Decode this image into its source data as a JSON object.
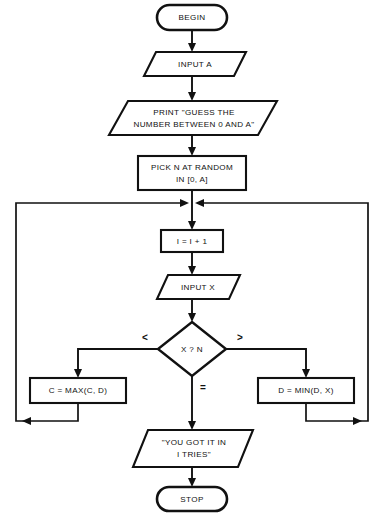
{
  "diagram": {
    "type": "flowchart",
    "canvas": {
      "width": 384,
      "height": 514
    },
    "colors": {
      "background": "#ffffff",
      "stroke": "#111111",
      "fill": "#ffffff"
    }
  },
  "nodes": {
    "begin": {
      "shape": "terminal",
      "label": "BEGIN"
    },
    "input_a": {
      "shape": "parallelogram",
      "label": "INPUT A"
    },
    "print_prompt": {
      "shape": "parallelogram",
      "line1": "PRINT \"GUESS THE",
      "line2": "NUMBER BETWEEN 0 AND A\""
    },
    "pick_n": {
      "shape": "process",
      "line1": "PICK N AT RANDOM",
      "line2": "IN [0, A]"
    },
    "increment_i": {
      "shape": "process",
      "label": "I = I + 1"
    },
    "input_x": {
      "shape": "parallelogram",
      "label": "INPUT X"
    },
    "compare": {
      "shape": "decision",
      "label": "X ? N"
    },
    "set_c": {
      "shape": "process",
      "label": "C = MAX(C, D)"
    },
    "set_d": {
      "shape": "process",
      "label": "D = MIN(D, X)"
    },
    "output_result": {
      "shape": "parallelogram",
      "line1": "\"YOU GOT IT IN",
      "line2": "I TRIES\""
    },
    "stop": {
      "shape": "terminal",
      "label": "STOP"
    }
  },
  "branch_labels": {
    "less_than": "<",
    "greater_than": ">",
    "equal": "="
  }
}
